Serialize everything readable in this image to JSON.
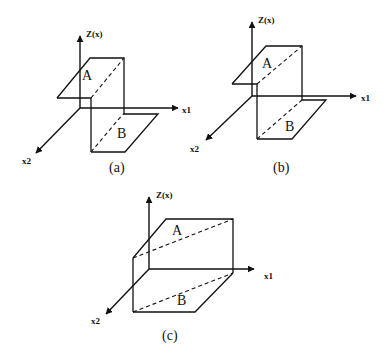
{
  "figure": {
    "panels": [
      {
        "id": "a",
        "caption": "(a)",
        "z_label": "Z(x)",
        "x1_label": "x1",
        "x2_label": "x2",
        "plane_upper_label": "A",
        "plane_lower_label": "B"
      },
      {
        "id": "b",
        "caption": "(b)",
        "z_label": "Z(x)",
        "x1_label": "x1",
        "x2_label": "x2",
        "plane_upper_label": "A",
        "plane_lower_label": "B"
      },
      {
        "id": "c",
        "caption": "(c)",
        "z_label": "Z(x)",
        "x1_label": "x1",
        "x2_label": "x2",
        "plane_upper_label": "A",
        "plane_lower_label": "B"
      }
    ]
  }
}
